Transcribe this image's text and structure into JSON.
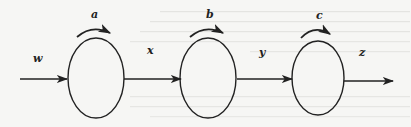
{
  "diagram": {
    "type": "flow-chain",
    "colors": {
      "background": "#f6f6f4",
      "stroke": "#222222",
      "bleed_through_text": "#d9d9d6"
    },
    "nodes": [
      {
        "id": "node1",
        "self_loop_label": "a",
        "cx": 96,
        "cy": 78,
        "rx": 28,
        "ry": 40
      },
      {
        "id": "node2",
        "self_loop_label": "b",
        "cx": 208,
        "cy": 78,
        "rx": 28,
        "ry": 40
      },
      {
        "id": "node3",
        "self_loop_label": "c",
        "cx": 318,
        "cy": 78,
        "rx": 26,
        "ry": 37
      }
    ],
    "edges": [
      {
        "label": "w",
        "from": "input",
        "to": "node1"
      },
      {
        "label": "x",
        "from": "node1",
        "to": "node2"
      },
      {
        "label": "y",
        "from": "node2",
        "to": "node3"
      },
      {
        "label": "z",
        "from": "node3",
        "to": "output"
      }
    ],
    "labels": {
      "w": "w",
      "a": "a",
      "x": "x",
      "b": "b",
      "y": "y",
      "c": "c",
      "z": "z"
    }
  }
}
